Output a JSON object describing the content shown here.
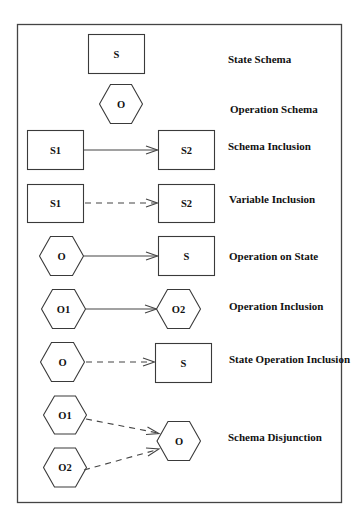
{
  "diagram": {
    "rows": [
      {
        "label": "State Schema",
        "nodes": [
          {
            "shape": "rect",
            "text": "S"
          }
        ],
        "edge": null
      },
      {
        "label": "Operation Schema",
        "nodes": [
          {
            "shape": "hexagon",
            "text": "O"
          }
        ],
        "edge": null
      },
      {
        "label": "Schema Inclusion",
        "nodes": [
          {
            "shape": "rect",
            "text": "S1"
          },
          {
            "shape": "rect",
            "text": "S2"
          }
        ],
        "edge": {
          "style": "solid",
          "from": "S1",
          "to": "S2"
        }
      },
      {
        "label": "Variable Inclusion",
        "nodes": [
          {
            "shape": "rect",
            "text": "S1"
          },
          {
            "shape": "rect",
            "text": "S2"
          }
        ],
        "edge": {
          "style": "dashed",
          "from": "S1",
          "to": "S2"
        }
      },
      {
        "label": "Operation on State",
        "nodes": [
          {
            "shape": "hexagon",
            "text": "O"
          },
          {
            "shape": "rect",
            "text": "S"
          }
        ],
        "edge": {
          "style": "solid",
          "from": "O",
          "to": "S"
        }
      },
      {
        "label": "Operation Inclusion",
        "nodes": [
          {
            "shape": "hexagon",
            "text": "O1"
          },
          {
            "shape": "hexagon",
            "text": "O2"
          }
        ],
        "edge": {
          "style": "solid",
          "from": "O1",
          "to": "O2"
        }
      },
      {
        "label": "State Operation Inclusion",
        "nodes": [
          {
            "shape": "hexagon",
            "text": "O"
          },
          {
            "shape": "rect",
            "text": "S"
          }
        ],
        "edge": {
          "style": "dashed",
          "from": "O",
          "to": "S"
        }
      },
      {
        "label": "Schema Disjunction",
        "nodes": [
          {
            "shape": "hexagon",
            "text": "O1"
          },
          {
            "shape": "hexagon",
            "text": "O2"
          },
          {
            "shape": "hexagon",
            "text": "O"
          }
        ],
        "edges": [
          {
            "style": "dashed",
            "from": "O1",
            "to": "O"
          },
          {
            "style": "dashed",
            "from": "O2",
            "to": "O"
          }
        ]
      }
    ],
    "colors": {
      "stroke": "#444444",
      "text": "#111111",
      "background": "#ffffff"
    }
  }
}
